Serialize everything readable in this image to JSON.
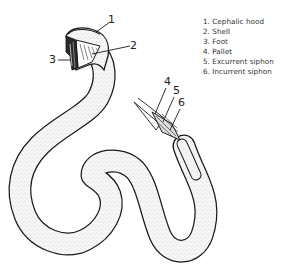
{
  "diagram": {
    "callouts": [
      {
        "number": "1",
        "x": 108,
        "y": 14
      },
      {
        "number": "2",
        "x": 130,
        "y": 40
      },
      {
        "number": "3",
        "x": 49,
        "y": 54
      },
      {
        "number": "4",
        "x": 164,
        "y": 76
      },
      {
        "number": "5",
        "x": 173,
        "y": 85
      },
      {
        "number": "6",
        "x": 178,
        "y": 97
      }
    ]
  },
  "legend": {
    "items": [
      {
        "label": "1. Cephalic hood"
      },
      {
        "label": "2. Shell"
      },
      {
        "label": "3. Foot"
      },
      {
        "label": "4. Pallet"
      },
      {
        "label": "5. Excurrent siphon"
      },
      {
        "label": "6. Incurrent siphon"
      }
    ]
  },
  "colors": {
    "ink": "#1a1a1a",
    "body_fill": "#f4f4f4",
    "background": "#ffffff"
  }
}
